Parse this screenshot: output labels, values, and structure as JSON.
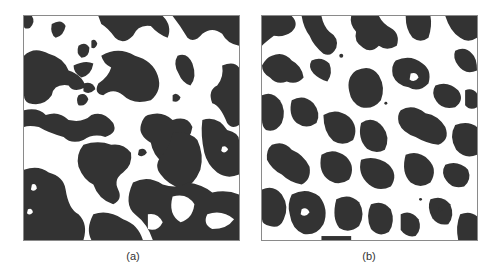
{
  "figure": {
    "panels": [
      {
        "id": "a",
        "label": "(a)",
        "description": "Binary two-phase microstructure with coarse, smooth domains"
      },
      {
        "id": "b",
        "label": "(b)",
        "description": "Binary two-phase microstructure with finer, irregular domains"
      }
    ],
    "colors": {
      "dark_phase": "#333333",
      "light_phase": "#ffffff",
      "border": "#8a8a8a",
      "caption": "#333333"
    }
  }
}
